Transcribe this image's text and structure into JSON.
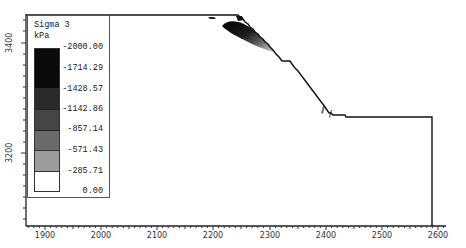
{
  "legend": {
    "title": "Sigma 3",
    "unit": "kPa",
    "levels": [
      {
        "label": "-2000.00",
        "color": "#0a0a0a"
      },
      {
        "label": "-1714.29",
        "color": "#1c1c1c"
      },
      {
        "label": "-1428.57",
        "color": "#3a3a3a"
      },
      {
        "label": "-1142.86",
        "color": "#5e5e5e"
      },
      {
        "label": "-857.14",
        "color": "#8a8a8a"
      },
      {
        "label": "-571.43",
        "color": "#b4b4b4"
      },
      {
        "label": "-285.71",
        "color": "#ffffff"
      },
      {
        "label": "0.00",
        "color": ""
      }
    ]
  },
  "axes": {
    "x_ticks": [
      "1900",
      "2000",
      "2100",
      "2200",
      "2300",
      "2400",
      "2500",
      "2600"
    ],
    "y_ticks": [
      "3400",
      "3200"
    ]
  },
  "colors": {
    "axis": "#222222",
    "profile": "#111111",
    "background": "#ffffff"
  }
}
